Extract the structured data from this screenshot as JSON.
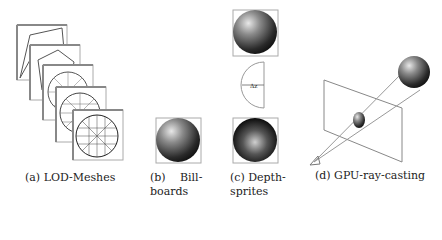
{
  "figure": {
    "panels": [
      {
        "id": "a",
        "caption": "(a) LOD-Meshes"
      },
      {
        "id": "b",
        "caption_line1_left": "(b)",
        "caption_line1_right": "Bill-",
        "caption_line2": "boards"
      },
      {
        "id": "c",
        "caption_line1": "(c) Depth-",
        "caption_line2": "sprites",
        "diagram_label": "Δz"
      },
      {
        "id": "d",
        "caption": "(d) GPU-ray-casting"
      }
    ]
  }
}
